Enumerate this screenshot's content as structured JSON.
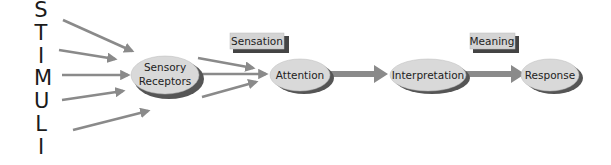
{
  "stimuli_letters": [
    "S",
    "T",
    "I",
    "M",
    "U",
    "L",
    "I"
  ],
  "nodes": {
    "sensory_receptors": {
      "line1": "Sensory",
      "line2": "Receptors"
    },
    "attention": {
      "label": "Attention"
    },
    "interpretation": {
      "label": "Interpretation"
    },
    "response": {
      "label": "Response"
    }
  },
  "boxes": {
    "sensation": {
      "label": "Sensation"
    },
    "meaning": {
      "label": "Meaning"
    }
  },
  "colors": {
    "arrow": "#8a8a8a",
    "ellipse_fill": "#d9d9d9",
    "ellipse_shadow": "#555555",
    "box_fill": "#d4d4d4",
    "box_shadow": "#444444",
    "text": "#222222"
  }
}
